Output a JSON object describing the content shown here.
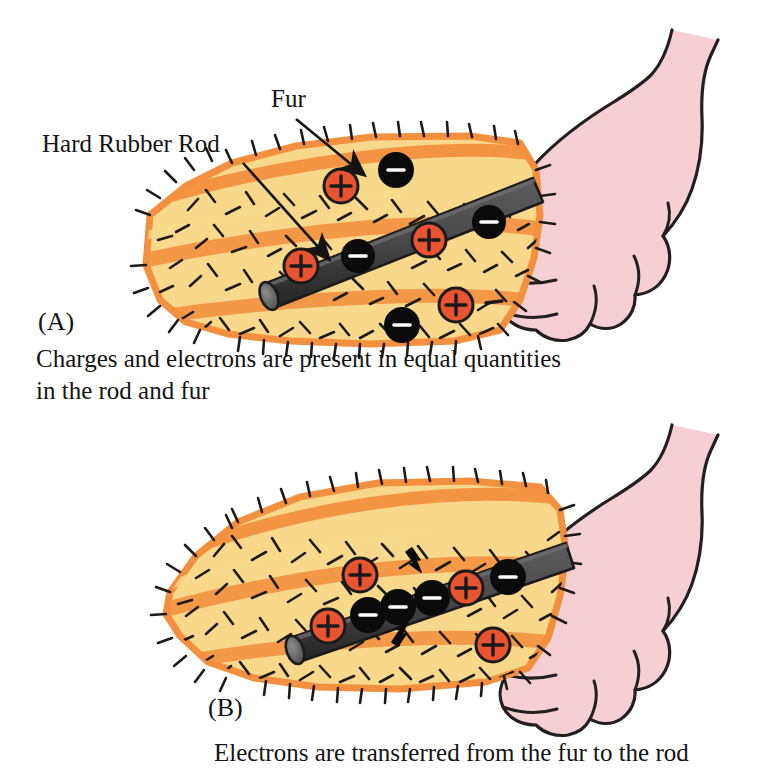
{
  "figure": {
    "title_absent": true,
    "background_color": "#ffffff",
    "panels": [
      {
        "id": "A",
        "panel_label": "(A)",
        "caption_lines": [
          "Charges and electrons are present in equal quantities",
          "in the rod and fur"
        ],
        "callouts": [
          {
            "name": "fur-label",
            "text": "Fur"
          },
          {
            "name": "rod-label",
            "text": "Hard Rubber Rod"
          }
        ],
        "charges": {
          "fur": [
            {
              "sign": "+",
              "x": 341,
              "y": 186
            },
            {
              "sign": "-",
              "x": 396,
              "y": 170
            },
            {
              "sign": "+",
              "x": 456,
              "y": 305
            },
            {
              "sign": "-",
              "x": 402,
              "y": 325
            },
            {
              "sign": "-",
              "x": 494,
              "y": 308,
              "style": "bare"
            }
          ],
          "rod": [
            {
              "sign": "+",
              "x": 301,
              "y": 266
            },
            {
              "sign": "-",
              "x": 358,
              "y": 256
            },
            {
              "sign": "+",
              "x": 429,
              "y": 240
            },
            {
              "sign": "-",
              "x": 489,
              "y": 222
            }
          ]
        },
        "transfer_arrows": []
      },
      {
        "id": "B",
        "panel_label": "(B)",
        "caption_lines": [
          "Electrons are transferred from the fur to the rod"
        ],
        "callouts": [],
        "charges": {
          "fur": [
            {
              "sign": "+",
              "x": 360,
              "y": 575
            },
            {
              "sign": "+",
              "x": 493,
              "y": 645
            }
          ],
          "rod": [
            {
              "sign": "+",
              "x": 328,
              "y": 626
            },
            {
              "sign": "-",
              "x": 367,
              "y": 613
            },
            {
              "sign": "-",
              "x": 396,
              "y": 606
            },
            {
              "sign": "-",
              "x": 432,
              "y": 598
            },
            {
              "sign": "+",
              "x": 465,
              "y": 588
            },
            {
              "sign": "-",
              "x": 508,
              "y": 577
            }
          ]
        },
        "transfer_arrows": [
          {
            "name": "electron-transfer-arrow-top",
            "direction": "down"
          },
          {
            "name": "electron-transfer-arrow-bottom",
            "direction": "up"
          }
        ]
      }
    ],
    "colors": {
      "fur_body": "#F8D98C",
      "fur_streak": "#F2903F",
      "fur_hair": "#1d1a17",
      "rod_body": "#4a4a4a",
      "rod_dark": "#2c2c2c",
      "rod_cap": "#6e6e6e",
      "hand_fill": "#F6CFD5",
      "hand_outline": "#231f20",
      "positive_charge": "#E8542F",
      "negative_charge": "#0b0b0b",
      "charge_outline": "#1a1a1a",
      "text": "#141414"
    },
    "objects": [
      {
        "name": "fur-patch",
        "label": "Fur"
      },
      {
        "name": "hard-rubber-rod",
        "label": "Hard Rubber Rod"
      },
      {
        "name": "hand",
        "label": "Hand"
      }
    ]
  }
}
